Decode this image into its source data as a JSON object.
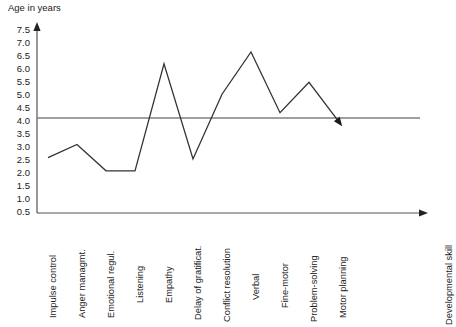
{
  "chart_data": {
    "type": "line",
    "title": "",
    "ylabel": "Age in years",
    "xlabel": "Developmental skill",
    "ylim": [
      0,
      7.5
    ],
    "grid": false,
    "legend": null,
    "y_ticks": [
      "0.5",
      "1.0",
      "1.5",
      "2.0",
      "2.5",
      "3.0",
      "3.5",
      "4.0",
      "4.5",
      "5.0",
      "5.5",
      "6.0",
      "6.5",
      "7.0",
      "7.5"
    ],
    "y_tick_values": [
      0.5,
      1.0,
      1.5,
      2.0,
      2.5,
      3.0,
      3.5,
      4.0,
      4.5,
      5.0,
      5.5,
      6.0,
      6.5,
      7.0,
      7.5
    ],
    "categories": [
      "Impulse control",
      "Anger managmt.",
      "Emotional regul.",
      "Listening",
      "Empathy",
      "Delay of gratificat.",
      "Conflict resolution",
      "Verbal",
      "Fine-motor",
      "Problem-solving",
      "Motor planning"
    ],
    "values": [
      2.35,
      2.85,
      1.85,
      1.85,
      5.9,
      2.3,
      4.75,
      6.35,
      4.05,
      5.2,
      3.75
    ],
    "series": [
      {
        "name": "Developmental age",
        "values": [
          2.35,
          2.85,
          1.85,
          1.85,
          5.9,
          2.3,
          4.75,
          6.35,
          4.05,
          5.2,
          3.75
        ],
        "color": "#333333",
        "arrow_end": true
      }
    ],
    "annotations": [
      {
        "type": "horizontal-reference-line",
        "value": 3.85,
        "color": "#808080",
        "label": ""
      }
    ],
    "axes": {
      "y_axis_arrow": true,
      "x_axis_arrow": true,
      "axis_color": "#555555"
    }
  }
}
